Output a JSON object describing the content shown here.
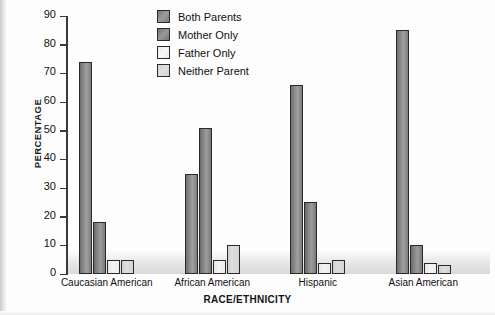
{
  "chart_data": {
    "type": "bar",
    "title": "",
    "xlabel": "RACE/ETHNICITY",
    "ylabel": "PERCENTAGE",
    "ylim": [
      0,
      90
    ],
    "yticks": [
      0,
      10,
      20,
      30,
      40,
      50,
      60,
      70,
      80,
      90
    ],
    "grid": false,
    "legend_position": "top-center",
    "categories": [
      "Caucasian American",
      "African American",
      "Hispanic",
      "Asian American"
    ],
    "series": [
      {
        "name": "Both Parents",
        "color": "#8d8d8d",
        "values": [
          74,
          35,
          66,
          85
        ]
      },
      {
        "name": "Mother Only",
        "color": "#8a8a8a",
        "values": [
          18,
          51,
          25,
          10
        ]
      },
      {
        "name": "Father Only",
        "color": "#f1f1f1",
        "values": [
          5,
          5,
          4,
          4
        ]
      },
      {
        "name": "Neither Parent",
        "color": "#d8d8d8",
        "values": [
          5,
          10,
          5,
          3
        ]
      }
    ]
  },
  "axis": {
    "y_title": "PERCENTAGE",
    "x_title": "RACE/ETHNICITY",
    "y_tick_labels": [
      "90",
      "80",
      "70",
      "60",
      "50",
      "40",
      "30",
      "20",
      "10",
      "0"
    ]
  },
  "legend": {
    "items": [
      {
        "label": "Both Parents"
      },
      {
        "label": "Mother Only"
      },
      {
        "label": "Father Only"
      },
      {
        "label": "Neither Parent"
      }
    ]
  }
}
